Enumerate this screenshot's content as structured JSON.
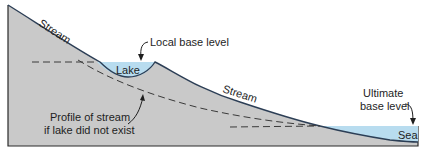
{
  "diagram": {
    "colors": {
      "land": "#c9c9c9",
      "water": "#b8dcef",
      "outline": "#2a2a2a",
      "stream_line": "#2c3e55",
      "dashed_line": "#3a3a3a",
      "text": "#1e1e1e"
    },
    "labels": {
      "stream_upper": "Stream",
      "stream_lower": "Stream",
      "lake": "Lake",
      "local_base_level": "Local base level",
      "profile_line1": "Profile of stream",
      "profile_line2": "if lake did not exist",
      "ultimate_line1": "Ultimate",
      "ultimate_line2": "base level",
      "sea": "Sea"
    }
  }
}
